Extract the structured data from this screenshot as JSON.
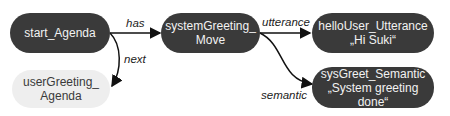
{
  "nodes": {
    "start_agenda": {
      "line1": "start_Agenda",
      "line2": "",
      "style": "dark"
    },
    "system_greeting_move": {
      "line1": "systemGreeting_",
      "line2": "Move",
      "style": "dark"
    },
    "user_greeting_agenda": {
      "line1": "userGreeting_",
      "line2": "Agenda",
      "style": "light"
    },
    "hello_user_utterance": {
      "line1": "helloUser_Utterance",
      "line2": "„Hi Suki“",
      "style": "dark"
    },
    "sys_greet_semantic": {
      "line1": "sysGreet_Semantic",
      "line2": "„System greeting",
      "line3": "done“",
      "style": "dark"
    }
  },
  "edges": {
    "has": "has",
    "next": "next",
    "utterance": "utterance",
    "semantic": "semantic"
  },
  "colors": {
    "dark_node": "#3a3a3a",
    "light_node": "#eeeeee",
    "arrow": "#111111"
  }
}
